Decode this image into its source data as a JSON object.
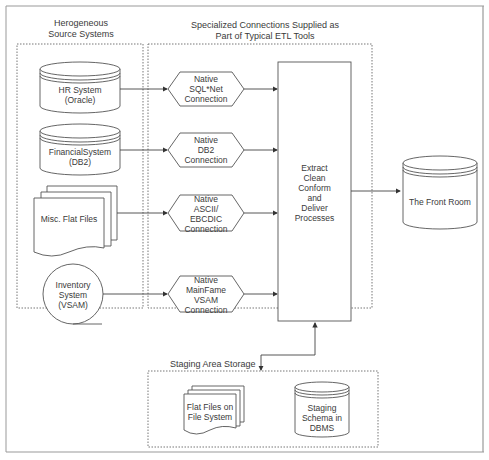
{
  "diagram": {
    "sections": {
      "sources_title": "Herogeneous\nSource Systems",
      "connections_title": "Specialized Connections Supplied as\nPart of Typical ETL Tools",
      "staging_title": "Staging Area Storage"
    },
    "sources": [
      {
        "label": "HR System\n(Oracle)",
        "shape": "cylinder"
      },
      {
        "label": "FinancialSystem\n(DB2)",
        "shape": "cylinder"
      },
      {
        "label": "Misc. Flat Files",
        "shape": "multi-document"
      },
      {
        "label": "Inventory\nSystem\n(VSAM)",
        "shape": "sequential-storage"
      }
    ],
    "connections": [
      {
        "label": "Native\nSQL*Net\nConnection"
      },
      {
        "label": "Native\nDB2\nConnection"
      },
      {
        "label": "Native\nASCII/\nEBCDIC\nConnection"
      },
      {
        "label": "Native\nMainFame\nVSAM\nConnection"
      }
    ],
    "process": {
      "label": "Extract\nClean\nConform\nand\nDeliver\nProcesses"
    },
    "target": {
      "label": "The Front Room",
      "shape": "cylinder"
    },
    "staging": [
      {
        "label": "Flat Files on\nFile System",
        "shape": "multi-document"
      },
      {
        "label": "Staging\nSchema in\nDBMS",
        "shape": "cylinder"
      }
    ],
    "colors": {
      "line": "#555555",
      "border": "#888888",
      "dotted": "#777777"
    }
  }
}
